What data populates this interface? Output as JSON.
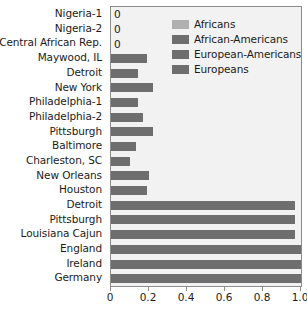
{
  "chart_data": {
    "type": "bar",
    "orientation": "horizontal",
    "title": "",
    "xlabel": "",
    "ylabel": "",
    "xlim": [
      0,
      1.0
    ],
    "xticks": [
      "0",
      "0.2",
      "0.4",
      "0.6",
      "0.8",
      "1.0"
    ],
    "xtick_values": [
      0,
      0.2,
      0.4,
      0.6,
      0.8,
      1.0
    ],
    "grid": false,
    "legend_position": "upper right",
    "categories": [
      "Nigeria-1",
      "Nigeria-2",
      "Central African Rep.",
      "Maywood, IL",
      "Detroit",
      "New York",
      "Philadelphia-1",
      "Philadelphia-2",
      "Pittsburgh",
      "Baltimore",
      "Charleston, SC",
      "New Orleans",
      "Houston",
      "Detroit",
      "Pittsburgh",
      "Louisiana Cajun",
      "England",
      "Ireland",
      "Germany"
    ],
    "values": [
      0,
      0,
      0,
      0.19,
      0.14,
      0.22,
      0.14,
      0.17,
      0.22,
      0.13,
      0.1,
      0.2,
      0.19,
      0.97,
      0.97,
      0.97,
      1.0,
      1.0,
      1.0
    ],
    "point_labels": [
      "0",
      "0",
      "0",
      "",
      "",
      "",
      "",
      "",
      "",
      "",
      "",
      "",
      "",
      "",
      "",
      "",
      "",
      "",
      ""
    ],
    "groups": [
      "Africans",
      "Africans",
      "Africans",
      "African-Americans",
      "African-Americans",
      "African-Americans",
      "African-Americans",
      "African-Americans",
      "African-Americans",
      "African-Americans",
      "African-Americans",
      "African-Americans",
      "African-Americans",
      "European-Americans",
      "European-Americans",
      "European-Americans",
      "Europeans",
      "Europeans",
      "Europeans"
    ],
    "legend": [
      {
        "label": "Africans",
        "color": "#b0b0b0"
      },
      {
        "label": "African-Americans",
        "color": "#6e6e6e"
      },
      {
        "label": "European-Americans",
        "color": "#6e6e6e"
      },
      {
        "label": "Europeans",
        "color": "#6e6e6e"
      }
    ],
    "bar_color": "#6e6e6e",
    "plot_background": "#f2f2f2",
    "axis_color": "#8c8c8c",
    "text_color": "#1b1b1b"
  }
}
